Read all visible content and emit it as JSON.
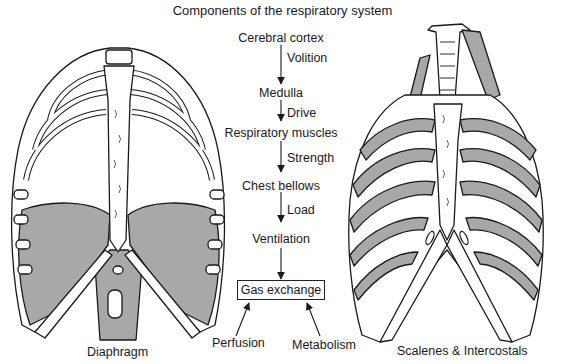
{
  "title": "Components of the respiratory system",
  "flow": {
    "nodes": [
      {
        "id": "cerebral_cortex",
        "label": "Cerebral cortex"
      },
      {
        "id": "medulla",
        "label": "Medulla"
      },
      {
        "id": "respiratory_muscles",
        "label": "Respiratory muscles"
      },
      {
        "id": "chest_bellows",
        "label": "Chest bellows"
      },
      {
        "id": "ventilation",
        "label": "Ventilation"
      },
      {
        "id": "gas_exchange",
        "label": "Gas exchange"
      }
    ],
    "edges": [
      {
        "from": "cerebral_cortex",
        "to": "medulla",
        "label": "Volition"
      },
      {
        "from": "medulla",
        "to": "respiratory_muscles",
        "label": "Drive"
      },
      {
        "from": "respiratory_muscles",
        "to": "chest_bellows",
        "label": "Strength"
      },
      {
        "from": "chest_bellows",
        "to": "ventilation",
        "label": "Load"
      },
      {
        "from": "ventilation",
        "to": "gas_exchange",
        "label": ""
      }
    ],
    "inputs": [
      {
        "label": "Perfusion",
        "to": "gas_exchange"
      },
      {
        "label": "Metabolism",
        "to": "gas_exchange"
      }
    ]
  },
  "figures": {
    "left": {
      "caption": "Diaphragm",
      "icon": "rib-cage-diaphragm-illustration"
    },
    "right": {
      "caption": "Scalenes & Intercostals",
      "icon": "rib-cage-intercostals-illustration"
    }
  },
  "colors": {
    "muscle_fill": "#a8a8a8",
    "line": "#1a1a1a",
    "background": "#ffffff"
  }
}
